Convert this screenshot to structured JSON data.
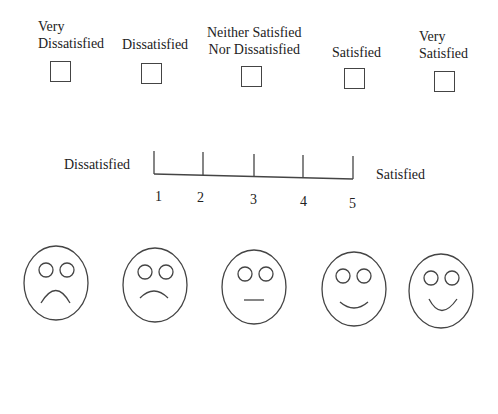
{
  "checkbox_scale": {
    "options": [
      {
        "label_line1": "Very",
        "label_line2": "Dissatisfied"
      },
      {
        "label_line1": "",
        "label_line2": "Dissatisfied"
      },
      {
        "label_line1": "Neither Satisfied",
        "label_line2": "Nor Dissatisfied"
      },
      {
        "label_line1": "",
        "label_line2": "Satisfied"
      },
      {
        "label_line1": "Very",
        "label_line2": "Satisfied"
      }
    ]
  },
  "numeric_scale": {
    "left_label": "Dissatisfied",
    "right_label": "Satisfied",
    "ticks": [
      "1",
      "2",
      "3",
      "4",
      "5"
    ]
  },
  "face_scale": {
    "faces": [
      {
        "name": "very-sad-face"
      },
      {
        "name": "sad-face"
      },
      {
        "name": "neutral-face"
      },
      {
        "name": "happy-face"
      },
      {
        "name": "very-happy-face"
      }
    ]
  },
  "colors": {
    "stroke": "#444444",
    "background": "#ffffff"
  }
}
